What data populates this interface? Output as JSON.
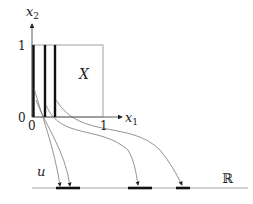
{
  "diagram": {
    "axes": {
      "x_label": "x",
      "x_sub": "1",
      "y_label": "x",
      "y_sub": "2",
      "tick_x0": "0",
      "tick_x1": "1",
      "tick_y0": "0",
      "tick_y1": "1"
    },
    "region_label": "X",
    "map_label": "u",
    "codomain_label": "ℝ",
    "colors": {
      "stroke": "#333333",
      "thin": "#777777",
      "thick": "#111111"
    }
  }
}
